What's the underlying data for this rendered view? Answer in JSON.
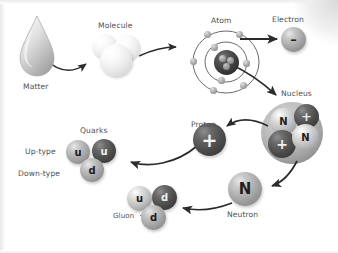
{
  "diagram": {
    "background_color": "#ffffff",
    "label_color": "#4f4f4f"
  },
  "labels": {
    "matter": "Matter",
    "molecule": "Molecule",
    "atom": "Atom",
    "electron": "Electron",
    "nucleus": "Nucleus",
    "proton": "Proton",
    "neutron": "Neutron",
    "quarks": "Quarks",
    "up_type": "Up-type",
    "down_type": "Down-type",
    "gluon": "Gluon"
  },
  "glyphs": {
    "neutron_symbol": "N",
    "proton_symbol": "+",
    "electron_symbol": "–",
    "up_quark": "u",
    "down_quark": "d"
  },
  "nucleus_particles": [
    {
      "symbol": "N",
      "tone": "light"
    },
    {
      "symbol": "+",
      "tone": "dark"
    },
    {
      "symbol": "+",
      "tone": "dark"
    },
    {
      "symbol": "N",
      "tone": "light"
    }
  ],
  "proton_quarks": [
    {
      "symbol": "u",
      "tone": "mid"
    },
    {
      "symbol": "u",
      "tone": "dark"
    },
    {
      "symbol": "d",
      "tone": "mid"
    }
  ],
  "neutron_quarks": [
    {
      "symbol": "u",
      "tone": "light"
    },
    {
      "symbol": "d",
      "tone": "dark"
    },
    {
      "symbol": "d",
      "tone": "mid"
    }
  ],
  "atom": {
    "outer_orbit_electrons": 5,
    "inner_orbit_electrons": 3
  },
  "flow": [
    "Matter",
    "Molecule",
    "Atom",
    "Electron",
    "Nucleus",
    "Proton",
    "Neutron",
    "Quarks"
  ]
}
